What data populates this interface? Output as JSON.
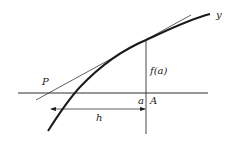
{
  "diagram": {
    "type": "tangent-line-geometry",
    "labels": {
      "curve": "y",
      "point_p": "P",
      "function_value": "f(a)",
      "x_value": "a",
      "point_a": "A",
      "distance": "h"
    },
    "colors": {
      "line": "#1a1a1a",
      "background": "#ffffff"
    }
  }
}
